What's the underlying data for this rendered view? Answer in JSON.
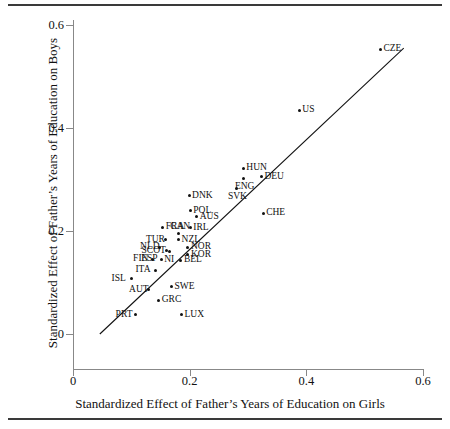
{
  "figure": {
    "name": "scatter-father-education-effect",
    "has_top_rule": true,
    "has_bottom_rule": true
  },
  "chart_data": {
    "type": "scatter",
    "title": "",
    "xlabel": "Standardized Effect of Father’s Years of Education on Girls",
    "ylabel": "Standardized Effect of Father’s Years of Education on Boys",
    "xlim": [
      0,
      0.6
    ],
    "ylim": [
      0,
      0.6
    ],
    "xticks": [
      0,
      0.2,
      0.4,
      0.6
    ],
    "yticks": [
      0,
      0.2,
      0.4,
      0.6
    ],
    "xticklabels": [
      "0",
      "0.2",
      "0.4",
      "0.6"
    ],
    "yticklabels": [
      "0",
      "0.2",
      "0.4",
      "0.6"
    ],
    "grid": false,
    "legend": "none",
    "fit_line": {
      "visible": true,
      "x_start": 0.046,
      "y_start": 0.0,
      "x_end": 0.567,
      "y_end": 0.555
    },
    "point_label_position": "right",
    "points": [
      {
        "label": "CZE",
        "x": 0.527,
        "y": 0.553,
        "label_side": "right"
      },
      {
        "label": "US",
        "x": 0.388,
        "y": 0.434,
        "label_side": "right"
      },
      {
        "label": "HUN",
        "x": 0.292,
        "y": 0.322,
        "label_side": "right"
      },
      {
        "label": "DEU",
        "x": 0.323,
        "y": 0.305,
        "label_side": "right"
      },
      {
        "label": "ENG",
        "x": 0.292,
        "y": 0.301,
        "label_side": "below"
      },
      {
        "label": "SVK",
        "x": 0.28,
        "y": 0.282,
        "label_side": "below"
      },
      {
        "label": "CHE",
        "x": 0.326,
        "y": 0.234,
        "label_side": "right"
      },
      {
        "label": "DNK",
        "x": 0.199,
        "y": 0.268,
        "label_side": "right"
      },
      {
        "label": "POL",
        "x": 0.201,
        "y": 0.239,
        "label_side": "right"
      },
      {
        "label": "AUS",
        "x": 0.212,
        "y": 0.228,
        "label_side": "right"
      },
      {
        "label": "IRL",
        "x": 0.201,
        "y": 0.206,
        "label_side": "right"
      },
      {
        "label": "FRA",
        "x": 0.154,
        "y": 0.207,
        "label_side": "right"
      },
      {
        "label": "CAN",
        "x": 0.181,
        "y": 0.195,
        "label_side": "above"
      },
      {
        "label": "NZL",
        "x": 0.181,
        "y": 0.183,
        "label_side": "right"
      },
      {
        "label": "TUR",
        "x": 0.159,
        "y": 0.183,
        "label_side": "left"
      },
      {
        "label": "NLD",
        "x": 0.149,
        "y": 0.168,
        "label_side": "left"
      },
      {
        "label": "NI",
        "x": 0.166,
        "y": 0.16,
        "label_side": "below"
      },
      {
        "label": "SCOT",
        "x": 0.161,
        "y": 0.162,
        "label_side": "left"
      },
      {
        "label": "NOR",
        "x": 0.197,
        "y": 0.168,
        "label_side": "right"
      },
      {
        "label": "KOR",
        "x": 0.197,
        "y": 0.154,
        "label_side": "right"
      },
      {
        "label": "ESP",
        "x": 0.151,
        "y": 0.145,
        "label_side": "left"
      },
      {
        "label": "FIN",
        "x": 0.137,
        "y": 0.145,
        "label_side": "left"
      },
      {
        "label": "BEL",
        "x": 0.185,
        "y": 0.143,
        "label_side": "right"
      },
      {
        "label": "ITA",
        "x": 0.141,
        "y": 0.124,
        "label_side": "left"
      },
      {
        "label": "ISL",
        "x": 0.1,
        "y": 0.107,
        "label_side": "left"
      },
      {
        "label": "SWE",
        "x": 0.169,
        "y": 0.092,
        "label_side": "right"
      },
      {
        "label": "AUT",
        "x": 0.13,
        "y": 0.086,
        "label_side": "left"
      },
      {
        "label": "GRC",
        "x": 0.147,
        "y": 0.066,
        "label_side": "right"
      },
      {
        "label": "PRT",
        "x": 0.107,
        "y": 0.037,
        "label_side": "left"
      },
      {
        "label": "LUX",
        "x": 0.186,
        "y": 0.037,
        "label_side": "right"
      }
    ]
  }
}
